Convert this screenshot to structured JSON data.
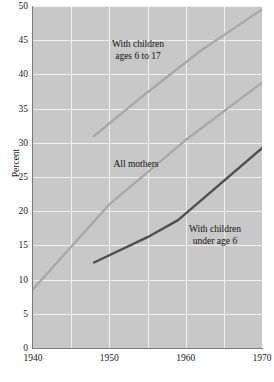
{
  "chart_data": {
    "type": "line",
    "title": "",
    "subtitle": "",
    "xlabel": "",
    "ylabel": "Percent",
    "xlim": [
      1940,
      1970
    ],
    "ylim": [
      0,
      50
    ],
    "grid": true,
    "legend_position": "inline-annotations",
    "background_color": "#c8c8c8",
    "gridline_color": "#efefef",
    "x_ticks": [
      1940,
      1950,
      1960,
      1970
    ],
    "x_tick_labels": [
      "1940",
      "1950",
      "1960",
      "1970"
    ],
    "x_minor_gridlines": [
      1945,
      1950,
      1955,
      1960,
      1965
    ],
    "y_ticks": [
      0,
      5,
      10,
      15,
      20,
      25,
      30,
      35,
      40,
      45,
      50
    ],
    "y_tick_labels": [
      "0",
      "5",
      "10",
      "15",
      "20",
      "25",
      "30",
      "35",
      "40",
      "45",
      "50"
    ],
    "series": [
      {
        "name": "With children ages 6 to 17",
        "color": "#a8a8a8",
        "line_width": 2.4,
        "x": [
          1948,
          1955,
          1962,
          1970
        ],
        "values": [
          31.0,
          37.4,
          43.5,
          49.5
        ]
      },
      {
        "name": "All mothers",
        "color": "#a8a8a8",
        "line_width": 2.4,
        "x": [
          1940,
          1950,
          1960,
          1970
        ],
        "values": [
          8.6,
          21.0,
          30.4,
          38.8
        ]
      },
      {
        "name": "With children under age 6",
        "color": "#4f4f4f",
        "line_width": 2.4,
        "x": [
          1948,
          1955,
          1959,
          1970
        ],
        "values": [
          12.5,
          16.2,
          18.7,
          29.2
        ]
      }
    ],
    "annotations": [
      {
        "text": "With children\nages 6 to 17",
        "x": 1953.5,
        "y": 44.0
      },
      {
        "text": "All mothers",
        "x": 1953.5,
        "y": 27.5
      },
      {
        "text": "With children\nunder age 6",
        "x": 1963.5,
        "y": 18.0
      }
    ]
  },
  "axis": {
    "y_label": "Percent",
    "y_ticks": [
      "50",
      "45",
      "40",
      "35",
      "30",
      "25",
      "20",
      "15",
      "10",
      "5",
      "0"
    ],
    "x_ticks": [
      "1940",
      "1950",
      "1960",
      "1970"
    ]
  },
  "labels": {
    "children_6_to_17": "With children\nages 6 to 17",
    "all_mothers": "All mothers",
    "children_under_6": "With children\nunder age 6"
  }
}
